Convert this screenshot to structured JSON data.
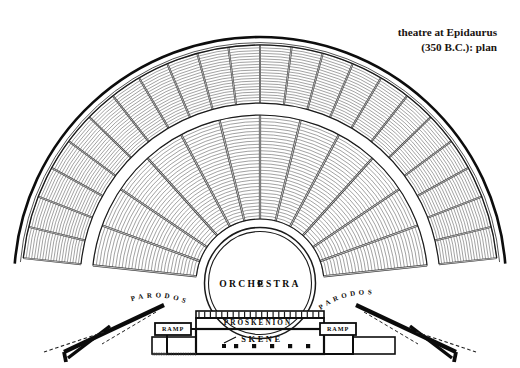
{
  "caption": {
    "line1": "theatre at Epidaurus",
    "line2": "(350 B.C.): plan"
  },
  "labels": {
    "orchestra": "ORCHESTRA",
    "proskenion": "PROSKENION",
    "skene": "SKENE",
    "ramp_left": "RAMP",
    "ramp_right": "RAMP",
    "parodos_left": "PARODOS",
    "parodos_right": "PARODOS"
  },
  "colors": {
    "ink": "#111111",
    "line": "#3a3a3a",
    "hairline": "#555555",
    "paper": "#ffffff",
    "wall": "#0b0b0b"
  },
  "geometry": {
    "center_x": 260,
    "center_y": 283,
    "orchestra_radius": 54,
    "lower_tier_inner": 64,
    "lower_tier_outer": 168,
    "diazoma_inner": 168,
    "diazoma_outer": 180,
    "upper_tier_inner": 180,
    "upper_tier_outer": 238,
    "outer_rim": 246,
    "lower_rows": 32,
    "upper_rows": 21,
    "lower_wedges": 12,
    "upper_wedges": 22,
    "fan_start_deg": 186,
    "fan_end_deg": 354
  }
}
